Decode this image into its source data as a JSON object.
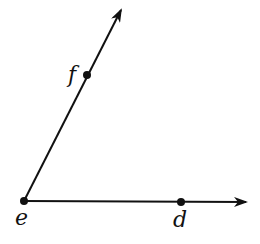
{
  "diagram": {
    "type": "angle",
    "vertex": {
      "label": "e",
      "x": 24,
      "y": 201
    },
    "points": [
      {
        "label": "f",
        "x": 87,
        "y": 75
      },
      {
        "label": "d",
        "x": 181,
        "y": 202
      }
    ],
    "rays": [
      {
        "name": "ray-ef",
        "from": "e",
        "through": "f",
        "tip": {
          "x": 121,
          "y": 10
        }
      },
      {
        "name": "ray-ed",
        "from": "e",
        "through": "d",
        "tip": {
          "x": 246,
          "y": 202
        }
      }
    ],
    "colors": {
      "stroke": "#111111",
      "background": "#ffffff"
    }
  }
}
